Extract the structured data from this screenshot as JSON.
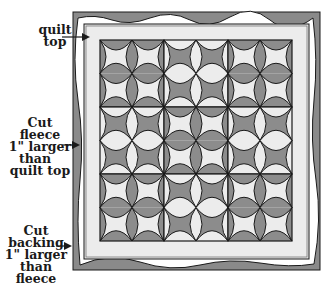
{
  "diagram": {
    "labels": {
      "quilt_top": [
        "quilt",
        "top"
      ],
      "fleece": [
        "Cut fleece",
        "1\" larger",
        "than",
        "quilt top"
      ],
      "backing": [
        "Cut",
        "backing",
        "1\" larger",
        "than fleece"
      ]
    },
    "layers": [
      "backing",
      "fleece",
      "quilt top"
    ],
    "grid": {
      "rows": 3,
      "cols": 3
    },
    "colors": {
      "dark": "#8c8c8c",
      "light": "#ececec",
      "backing": "#8a8a8a",
      "fleece": "#ffffff",
      "stroke": "#1a1a1a"
    }
  }
}
